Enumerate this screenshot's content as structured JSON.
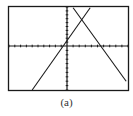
{
  "figure": {
    "caption": "(a)",
    "colors": {
      "ink": "#1a1a1a",
      "background": "#ffffff"
    }
  },
  "chart_data": {
    "type": "line",
    "title": "",
    "xlabel": "",
    "ylabel": "",
    "xlim": [
      -10,
      10
    ],
    "ylim": [
      -10,
      10
    ],
    "x_ticks_step": 1,
    "y_ticks_step": 1,
    "grid": false,
    "series": [
      {
        "name": "increasing-line",
        "points": [
          [
            -6,
            -10
          ],
          [
            3.8,
            9.8
          ]
        ]
      },
      {
        "name": "decreasing-line",
        "points": [
          [
            1,
            9.8
          ],
          [
            9.7,
            -8
          ]
        ]
      }
    ]
  }
}
